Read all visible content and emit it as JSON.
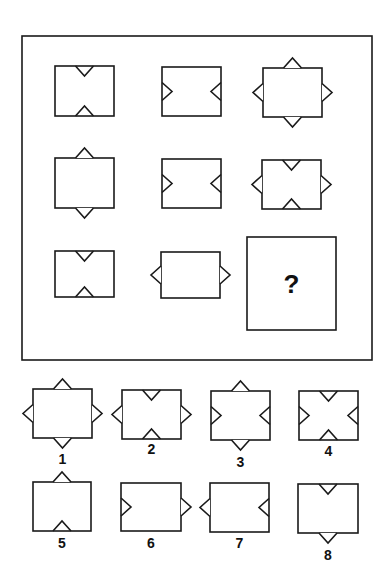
{
  "puzzle": {
    "frame": {
      "x": 22,
      "y": 36,
      "w": 350,
      "h": 324
    },
    "question_box": {
      "x": 247,
      "y": 237,
      "w": 89,
      "h": 93,
      "symbol": "?"
    },
    "matrix": [
      {
        "id": "r1c1",
        "x": 55,
        "y": 66,
        "w": 59,
        "h": 50,
        "notches": [
          {
            "side": "top",
            "dir": "in"
          },
          {
            "side": "bottom",
            "dir": "in"
          }
        ]
      },
      {
        "id": "r1c2",
        "x": 162,
        "y": 67,
        "w": 59,
        "h": 49,
        "notches": [
          {
            "side": "left",
            "dir": "in"
          },
          {
            "side": "right",
            "dir": "in"
          }
        ]
      },
      {
        "id": "r1c3",
        "x": 263,
        "y": 68,
        "w": 59,
        "h": 49,
        "notches": [
          {
            "side": "top",
            "dir": "out"
          },
          {
            "side": "bottom",
            "dir": "out"
          },
          {
            "side": "left",
            "dir": "out"
          },
          {
            "side": "right",
            "dir": "out"
          }
        ]
      },
      {
        "id": "r2c1",
        "x": 55,
        "y": 158,
        "w": 59,
        "h": 50,
        "notches": [
          {
            "side": "top",
            "dir": "out"
          },
          {
            "side": "bottom",
            "dir": "out"
          }
        ]
      },
      {
        "id": "r2c2",
        "x": 162,
        "y": 159,
        "w": 59,
        "h": 49,
        "notches": [
          {
            "side": "left",
            "dir": "in"
          },
          {
            "side": "right",
            "dir": "in"
          }
        ]
      },
      {
        "id": "r2c3",
        "x": 262,
        "y": 160,
        "w": 59,
        "h": 49,
        "notches": [
          {
            "side": "top",
            "dir": "in"
          },
          {
            "side": "bottom",
            "dir": "in"
          },
          {
            "side": "left",
            "dir": "out"
          },
          {
            "side": "right",
            "dir": "out"
          }
        ]
      },
      {
        "id": "r3c1",
        "x": 55,
        "y": 251,
        "w": 59,
        "h": 46,
        "notches": [
          {
            "side": "top",
            "dir": "in"
          },
          {
            "side": "bottom",
            "dir": "in"
          }
        ]
      },
      {
        "id": "r3c2",
        "x": 161,
        "y": 252,
        "w": 59,
        "h": 46,
        "notches": [
          {
            "side": "left",
            "dir": "out"
          },
          {
            "side": "right",
            "dir": "out"
          }
        ]
      }
    ],
    "options": [
      {
        "label": "1",
        "x": 33,
        "y": 389,
        "w": 59,
        "h": 49,
        "label_y": 452,
        "notches": [
          {
            "side": "top",
            "dir": "out"
          },
          {
            "side": "bottom",
            "dir": "out"
          },
          {
            "side": "left",
            "dir": "out"
          },
          {
            "side": "right",
            "dir": "out"
          }
        ]
      },
      {
        "label": "2",
        "x": 122,
        "y": 390,
        "w": 59,
        "h": 49,
        "label_y": 442,
        "notches": [
          {
            "side": "top",
            "dir": "in"
          },
          {
            "side": "bottom",
            "dir": "in"
          },
          {
            "side": "left",
            "dir": "out"
          },
          {
            "side": "right",
            "dir": "out"
          }
        ]
      },
      {
        "label": "3",
        "x": 211,
        "y": 391,
        "w": 59,
        "h": 49,
        "label_y": 455,
        "notches": [
          {
            "side": "top",
            "dir": "out"
          },
          {
            "side": "bottom",
            "dir": "out"
          },
          {
            "side": "left",
            "dir": "in"
          },
          {
            "side": "right",
            "dir": "in"
          }
        ]
      },
      {
        "label": "4",
        "x": 299,
        "y": 391,
        "w": 59,
        "h": 49,
        "label_y": 444,
        "notches": [
          {
            "side": "top",
            "dir": "in"
          },
          {
            "side": "bottom",
            "dir": "in"
          },
          {
            "side": "left",
            "dir": "in"
          },
          {
            "side": "right",
            "dir": "in"
          }
        ]
      },
      {
        "label": "5",
        "x": 33,
        "y": 482,
        "w": 58,
        "h": 49,
        "label_y": 536,
        "notches": [
          {
            "side": "top",
            "dir": "out"
          },
          {
            "side": "bottom",
            "dir": "in"
          }
        ]
      },
      {
        "label": "6",
        "x": 121,
        "y": 483,
        "w": 60,
        "h": 48,
        "label_y": 536,
        "notches": [
          {
            "side": "left",
            "dir": "in"
          },
          {
            "side": "right",
            "dir": "out"
          }
        ]
      },
      {
        "label": "7",
        "x": 210,
        "y": 483,
        "w": 59,
        "h": 49,
        "label_y": 536,
        "notches": [
          {
            "side": "left",
            "dir": "out"
          },
          {
            "side": "right",
            "dir": "in"
          }
        ]
      },
      {
        "label": "8",
        "x": 298,
        "y": 484,
        "w": 60,
        "h": 49,
        "label_y": 548,
        "notches": [
          {
            "side": "top",
            "dir": "in"
          },
          {
            "side": "bottom",
            "dir": "out"
          }
        ]
      }
    ],
    "stroke_color": "#1a1a1a"
  }
}
